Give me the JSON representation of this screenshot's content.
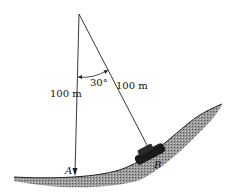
{
  "diagram": {
    "type": "pendulum-on-slope",
    "angle_label": "30°",
    "left_length_label": "100 m",
    "right_length_label": "100 m",
    "point_a_label": "A",
    "point_b_label": "B",
    "colors": {
      "line": "#222222",
      "ground_fill": "#8a8a8a",
      "car": "#1a1a1a"
    }
  }
}
